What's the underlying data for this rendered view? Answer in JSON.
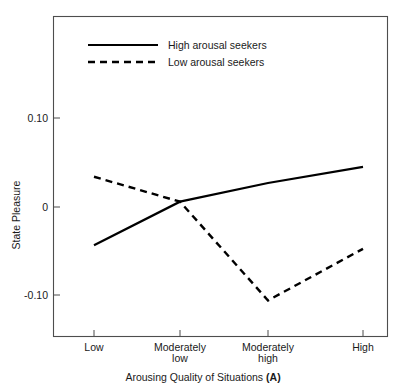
{
  "chart_data": {
    "type": "line",
    "title": "",
    "xlabel": "Arousing Quality of Situations (A)",
    "xlabel_plain": "Arousing Quality of Situations ",
    "xlabel_bold_suffix": "(A)",
    "ylabel": "State Pleasure",
    "categories": [
      "Low",
      "Moderately low",
      "Moderately high",
      "High"
    ],
    "category_lines": [
      [
        "Low",
        ""
      ],
      [
        "Moderately",
        "low"
      ],
      [
        "Moderately",
        "high"
      ],
      [
        "High",
        ""
      ]
    ],
    "ylim": [
      -0.145,
      0.135
    ],
    "yticks": [
      0.1,
      0,
      -0.1
    ],
    "ytick_labels": [
      "0.10",
      "0",
      "-0.10"
    ],
    "grid": false,
    "legend_position": "top-left-inside",
    "series": [
      {
        "name": "High arousal seekers",
        "style": "solid",
        "color": "#000000",
        "values": [
          -0.043,
          0.006,
          0.027,
          0.045
        ]
      },
      {
        "name": "Low arousal seekers",
        "style": "dashed",
        "color": "#000000",
        "values": [
          0.034,
          0.006,
          -0.105,
          -0.047
        ]
      }
    ]
  },
  "legend": {
    "items": [
      {
        "label": "High arousal seekers",
        "style": "solid"
      },
      {
        "label": "Low arousal seekers",
        "style": "dashed"
      }
    ]
  },
  "colors": {
    "background": "#ffffff",
    "ink": "#000000",
    "frame": "#4d4d4d"
  }
}
